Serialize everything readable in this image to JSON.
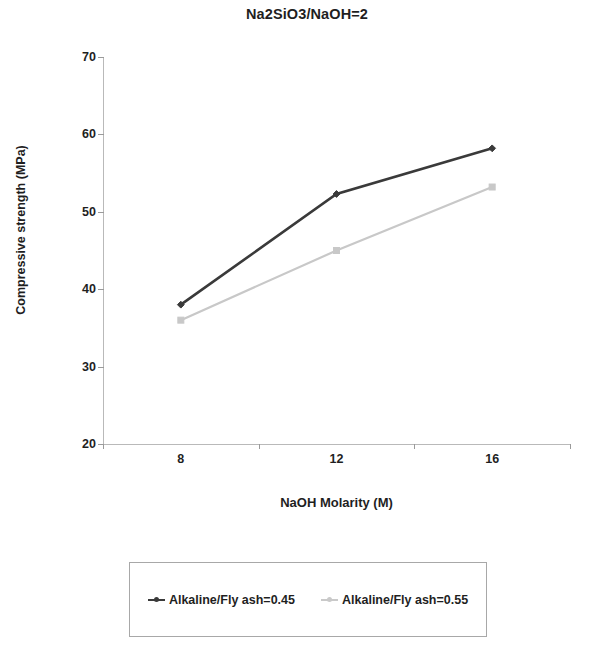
{
  "chart_data": {
    "type": "line",
    "title": "Na2SiO3/NaOH=2",
    "xlabel": "NaOH Molarity (M)",
    "ylabel": "Compressive strength (MPa)",
    "categories": [
      "8",
      "12",
      "16"
    ],
    "x": [
      8,
      12,
      16
    ],
    "ylim": [
      20,
      70
    ],
    "yticks": [
      20,
      30,
      40,
      50,
      60,
      70
    ],
    "ytick_labels": [
      "20",
      "30",
      "40",
      "50",
      "60",
      "70"
    ],
    "grid": false,
    "legend_position": "bottom",
    "series": [
      {
        "name": "Alkaline/Fly ash=0.45",
        "values": [
          38.0,
          52.3,
          58.2
        ],
        "color": "#3a3a3a",
        "marker": "diamond"
      },
      {
        "name": "Alkaline/Fly ash=0.55",
        "values": [
          36.0,
          45.0,
          53.2
        ],
        "color": "#c8c8c8",
        "marker": "square"
      }
    ]
  },
  "legend": {
    "entries": [
      {
        "label": "Alkaline/Fly ash=0.45",
        "color": "#3a3a3a"
      },
      {
        "label": "Alkaline/Fly ash=0.55",
        "color": "#c9c9c9"
      }
    ]
  }
}
